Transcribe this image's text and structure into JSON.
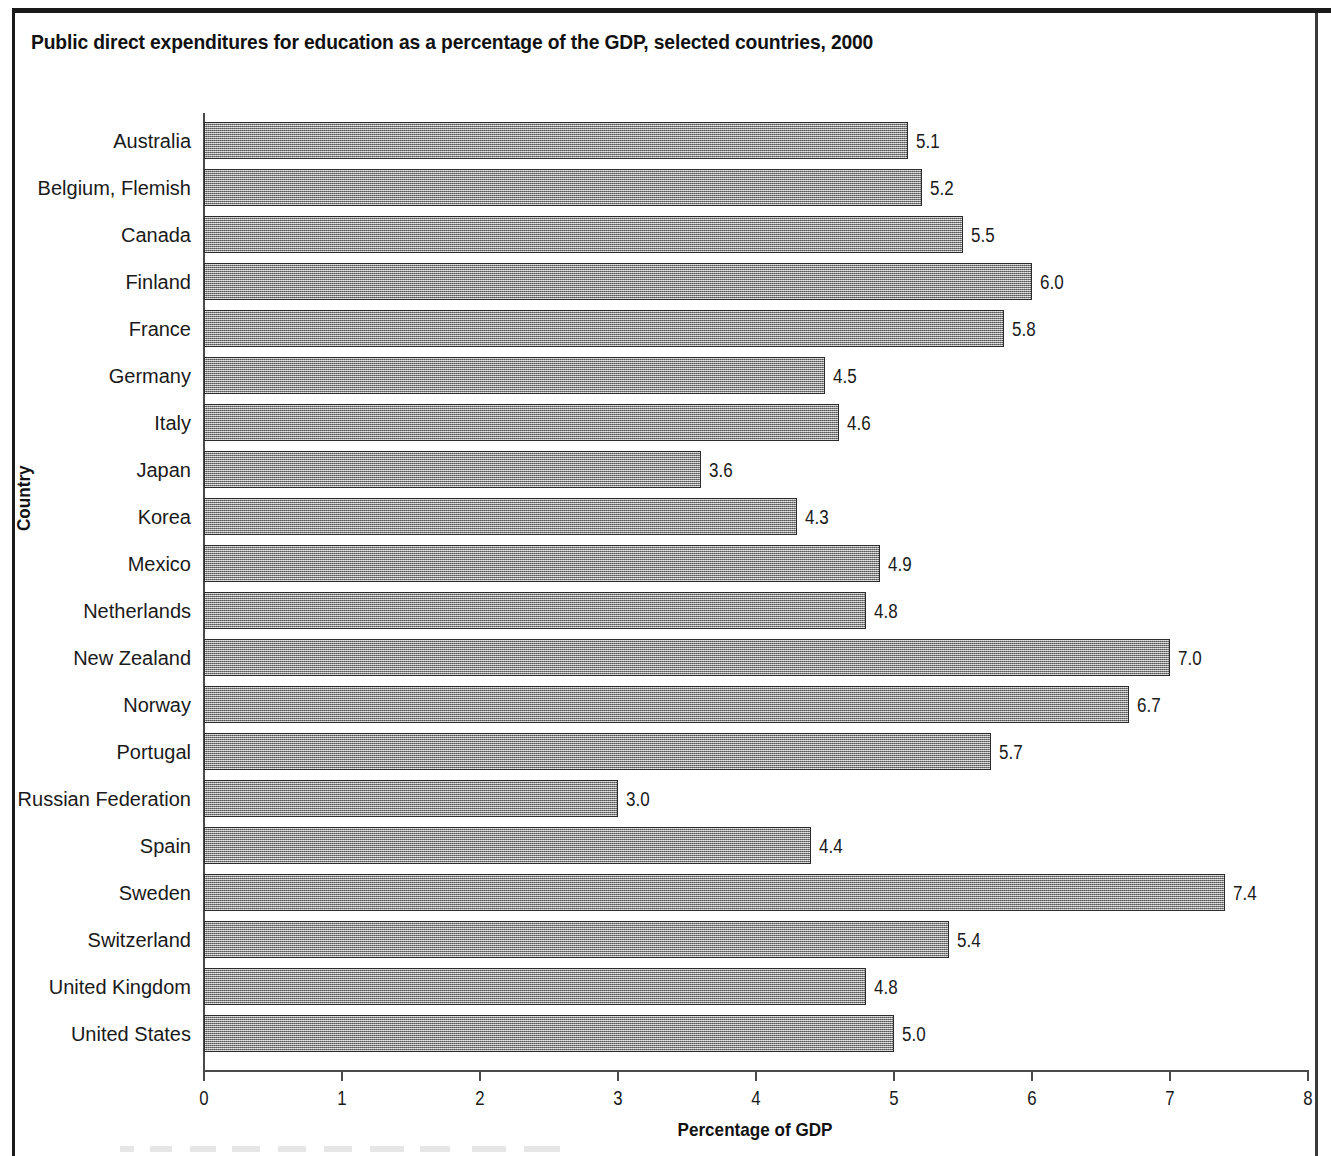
{
  "figure": {
    "title": "Public direct expenditures for education as a percentage of the GDP, selected countries, 2000"
  },
  "chart_data": {
    "type": "bar",
    "orientation": "horizontal",
    "title": "Public direct expenditures for education as a percentage of the GDP, selected countries, 2000",
    "xlabel": "Percentage of GDP",
    "ylabel": "Country",
    "xlim": [
      0,
      8
    ],
    "xticks": [
      "0",
      "1",
      "2",
      "3",
      "4",
      "5",
      "6",
      "7",
      "8"
    ],
    "grid": false,
    "legend": null,
    "bar_value_format": "one decimal",
    "categories": [
      "Australia",
      "Belgium, Flemish",
      "Canada",
      "Finland",
      "France",
      "Germany",
      "Italy",
      "Japan",
      "Korea",
      "Mexico",
      "Netherlands",
      "New Zealand",
      "Norway",
      "Portugal",
      "Russian Federation",
      "Spain",
      "Sweden",
      "Switzerland",
      "United Kingdom",
      "United States"
    ],
    "values": [
      5.1,
      5.2,
      5.5,
      6.0,
      5.8,
      4.5,
      4.6,
      3.6,
      4.3,
      4.9,
      4.8,
      7.0,
      6.7,
      5.7,
      3.0,
      4.4,
      7.4,
      5.4,
      4.8,
      5.0
    ],
    "value_labels": [
      "5.1",
      "5.2",
      "5.5",
      "6.0",
      "5.8",
      "4.5",
      "4.6",
      "3.6",
      "4.3",
      "4.9",
      "4.8",
      "7.0",
      "6.7",
      "5.7",
      "3.0",
      "4.4",
      "7.4",
      "5.4",
      "4.8",
      "5.0"
    ],
    "colors": {
      "bar_fill": "#a6a6a6",
      "bar_border": "#2b2b2b",
      "axis": "#4a4a4a",
      "text": "#1a1a1a",
      "frame": "#1a1a1a",
      "background": "#ffffff"
    }
  }
}
